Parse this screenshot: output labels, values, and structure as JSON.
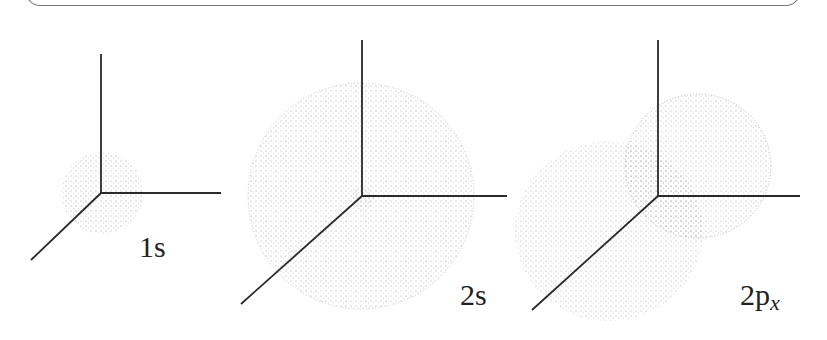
{
  "figure": {
    "panels": [
      {
        "id": "1s",
        "label_main": "1s",
        "label_sub": ""
      },
      {
        "id": "2s",
        "label_main": "2s",
        "label_sub": ""
      },
      {
        "id": "2px",
        "label_main": "2p",
        "label_sub": "x"
      }
    ]
  },
  "colors": {
    "axis": "#2a2a2a",
    "dots": "#8a8a8a",
    "frame": "#777777"
  }
}
